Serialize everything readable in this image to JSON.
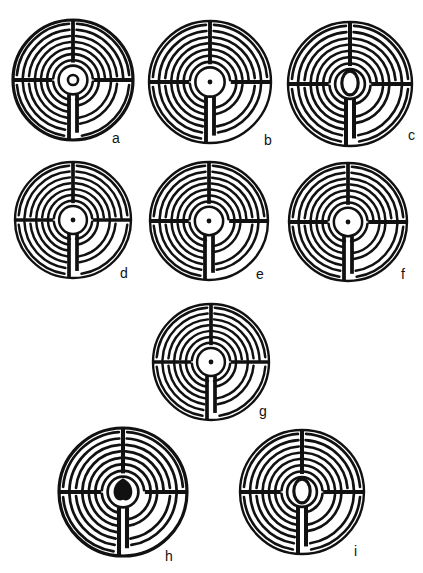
{
  "figures": [
    {
      "id": "a",
      "label": "a",
      "cx": 73,
      "cy": 80,
      "r": 60,
      "label_x": 112,
      "label_y": 131,
      "center": "keyhole"
    },
    {
      "id": "b",
      "label": "b",
      "cx": 210,
      "cy": 82,
      "r": 61,
      "label_x": 264,
      "label_y": 133,
      "center": "blob-dot"
    },
    {
      "id": "c",
      "label": "c",
      "cx": 350,
      "cy": 84,
      "r": 62,
      "label_x": 408,
      "label_y": 128,
      "center": "loop"
    },
    {
      "id": "d",
      "label": "d",
      "cx": 73,
      "cy": 220,
      "r": 58,
      "label_x": 120,
      "label_y": 266,
      "center": "dot-ring"
    },
    {
      "id": "e",
      "label": "e",
      "cx": 209,
      "cy": 221,
      "r": 59,
      "label_x": 256,
      "label_y": 267,
      "center": "blob-dot"
    },
    {
      "id": "f",
      "label": "f",
      "cx": 348,
      "cy": 222,
      "r": 59,
      "label_x": 401,
      "label_y": 267,
      "center": "dot-ring"
    },
    {
      "id": "g",
      "label": "g",
      "cx": 211,
      "cy": 362,
      "r": 58,
      "label_x": 259,
      "label_y": 404,
      "center": "rosette"
    },
    {
      "id": "h",
      "label": "h",
      "cx": 123,
      "cy": 492,
      "r": 64,
      "label_x": 165,
      "label_y": 549,
      "center": "teardrop"
    },
    {
      "id": "i",
      "label": "i",
      "cx": 302,
      "cy": 492,
      "r": 62,
      "label_x": 354,
      "label_y": 544,
      "center": "loop"
    }
  ],
  "style": {
    "ink": "#111111",
    "paper": "#ffffff",
    "circuits": 7
  }
}
